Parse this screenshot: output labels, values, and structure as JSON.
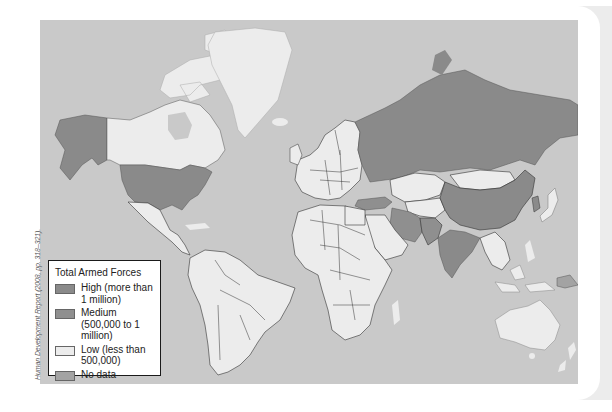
{
  "map": {
    "title": "Total Armed Forces",
    "source": "Human Development Report (2008, pp. 318–321).",
    "colors": {
      "ocean": "#c9c9c9",
      "high": "#8a8a8a",
      "medium": "#8f8f8f",
      "low": "#ececec",
      "no_data": "#a3a3a3",
      "border": "#333333"
    },
    "regions": {
      "high": [
        "United States",
        "Russia",
        "China",
        "India",
        "North Korea"
      ],
      "medium": [
        "Turkey",
        "Iran",
        "Pakistan",
        "South Korea",
        "Egypt",
        "Vietnam",
        "Myanmar"
      ],
      "low": [
        "Canada",
        "Greenland",
        "Mexico",
        "South America",
        "Europe",
        "Africa",
        "Kazakhstan",
        "Mongolia",
        "Australia",
        "Japan",
        "Southeast Asia"
      ],
      "no_data": [
        "Papua New Guinea"
      ]
    }
  },
  "legend": {
    "title": "Total Armed Forces",
    "items": [
      {
        "key": "high",
        "label": "High (more than 1 million)",
        "color": "#8a8a8a"
      },
      {
        "key": "medium",
        "label": "Medium (500,000 to 1 million)",
        "color": "#8f8f8f"
      },
      {
        "key": "low",
        "label": "Low (less than 500,000)",
        "color": "#ececec"
      },
      {
        "key": "no_data",
        "label": "No data",
        "color": "#a3a3a3"
      }
    ]
  }
}
